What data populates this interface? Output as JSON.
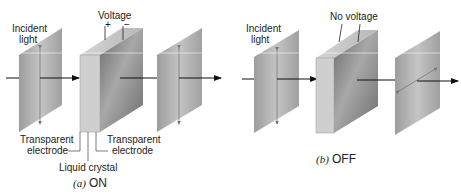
{
  "panel_a": {
    "incident_label_1": "Incident",
    "incident_label_2": "light",
    "voltage_label": "Voltage",
    "plus": "+",
    "minus": "−",
    "electrode_left_1": "Transparent",
    "electrode_left_2": "electrode",
    "electrode_right_1": "Transparent",
    "electrode_right_2": "electrode",
    "liquid_crystal": "Liquid crystal",
    "caption_letter": "(a)",
    "caption_state": "ON"
  },
  "panel_b": {
    "incident_label_1": "Incident",
    "incident_label_2": "light",
    "voltage_label": "No voltage",
    "caption_letter": "(b)",
    "caption_state": "OFF"
  },
  "colors": {
    "polarizer": "#a9a9a9",
    "cell_front": "#c9c9c9",
    "cell_face": "#7d7d7d",
    "arrow": "#111111"
  }
}
